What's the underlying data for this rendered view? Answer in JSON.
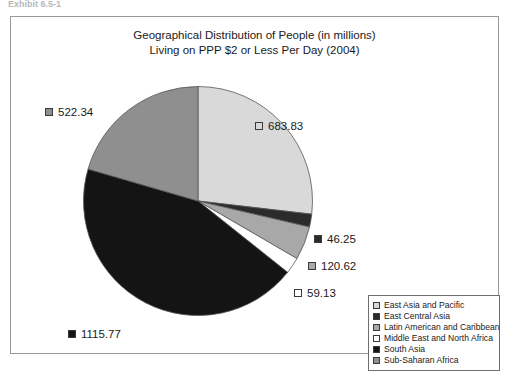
{
  "top_sliver_text": "Exhibit 6.5-1",
  "chart_data": {
    "type": "pie",
    "title": "Geographical Distribution of People (in millions)\nLiving on PPP $2 or Less Per Day (2004)",
    "unit": "millions of people",
    "categories": [
      "East Asia and Pacific",
      "East Central Asia",
      "Latin American and Caribbean",
      "Middle East and North Africa",
      "South Asia",
      "Sub-Saharan Africa"
    ],
    "values": [
      683.83,
      46.25,
      120.62,
      59.13,
      1115.77,
      522.34
    ],
    "colors": [
      "#d9d9d9",
      "#2b2b2b",
      "#a8a8a8",
      "#ffffff",
      "#141414",
      "#8f8f8f"
    ],
    "legend_position": "bottom-right",
    "start_angle_deg": 0,
    "direction": "clockwise",
    "slices": [
      {
        "label": "East Asia and Pacific",
        "value": 683.83,
        "value_text": "683.83",
        "color": "#d9d9d9"
      },
      {
        "label": "East Central Asia",
        "value": 46.25,
        "value_text": "46.25",
        "color": "#2b2b2b"
      },
      {
        "label": "Latin American and Caribbean",
        "value": 120.62,
        "value_text": "120.62",
        "color": "#a8a8a8"
      },
      {
        "label": "Middle East and North Africa",
        "value": 59.13,
        "value_text": "59.13",
        "color": "#ffffff"
      },
      {
        "label": "South Asia",
        "value": 1115.77,
        "value_text": "1115.77",
        "color": "#141414"
      },
      {
        "label": "Sub-Saharan Africa",
        "value": 522.34,
        "value_text": "522.34",
        "color": "#8f8f8f"
      }
    ]
  },
  "legend": {
    "items": [
      {
        "label": "East Asia and Pacific",
        "color": "#d9d9d9"
      },
      {
        "label": "East Central Asia",
        "color": "#2b2b2b"
      },
      {
        "label": "Latin American and Caribbean",
        "color": "#a8a8a8"
      },
      {
        "label": "Middle East and North Africa",
        "color": "#ffffff"
      },
      {
        "label": "South Asia",
        "color": "#141414"
      },
      {
        "label": "Sub-Saharan Africa",
        "color": "#8f8f8f"
      }
    ]
  }
}
